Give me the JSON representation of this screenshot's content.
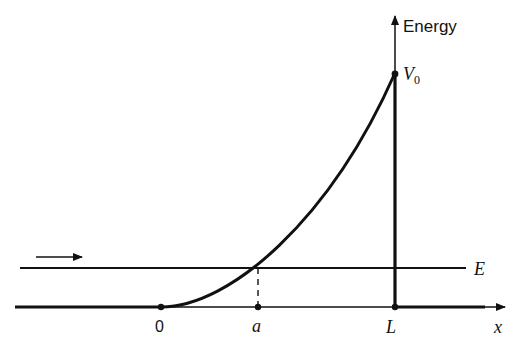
{
  "diagram": {
    "axis_labels": {
      "y": "Energy",
      "x": "x"
    },
    "potential_label_main": "V",
    "potential_label_sub": "0",
    "energy_label": "E",
    "tick_labels": {
      "origin": "0",
      "turning_point": "a",
      "barrier_end": "L"
    },
    "colors": {
      "stroke": "#111111",
      "background": "#ffffff"
    }
  }
}
